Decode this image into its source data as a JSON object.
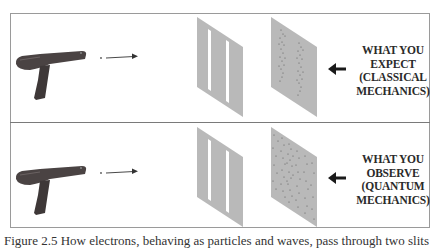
{
  "figure": {
    "panels": [
      {
        "id": "classical",
        "label_lines": [
          "WHAT YOU",
          "EXPECT",
          "(CLASSICAL",
          "MECHANICS)"
        ],
        "pattern": "two-bands"
      },
      {
        "id": "quantum",
        "label_lines": [
          "WHAT YOU",
          "OBSERVE",
          "(QUANTUM",
          "MECHANICS)"
        ],
        "pattern": "interference-scatter"
      }
    ],
    "caption": "Figure 2.5 How electrons, behaving as particles and waves, pass through two slits",
    "colors": {
      "screen": "#b9b9b9",
      "slit": "#ffffff",
      "gun": "#4a4343",
      "dots": "#5a5a5a",
      "arrow": "#1a1a1a",
      "border": "#9a9a9a"
    }
  }
}
